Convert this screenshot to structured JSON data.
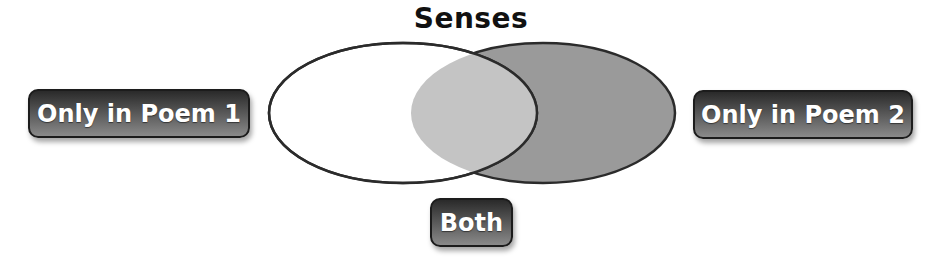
{
  "title": "Senses",
  "labels": {
    "left": "Only in Poem 1",
    "right": "Only in Poem 2",
    "center": "Both"
  },
  "colors": {
    "left_fill": "#ffffff",
    "right_fill": "#9a9a9a",
    "overlap_fill": "#c4c4c4",
    "outline": "#2b2b2b",
    "tag_fill": "#3c3c3c",
    "tag_text": "#ffffff"
  }
}
